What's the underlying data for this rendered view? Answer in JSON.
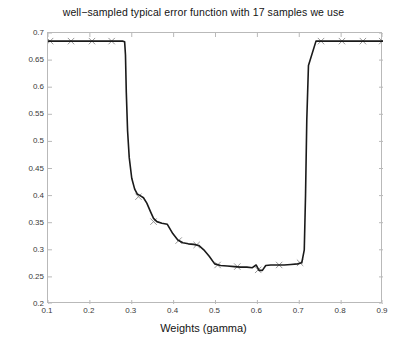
{
  "chart_data": {
    "type": "line",
    "title": "well−sampled typical error function with 17 samples we use",
    "xlabel": "Weights (gamma)",
    "ylabel": "Error",
    "xlim": [
      0.1,
      0.9
    ],
    "ylim": [
      0.2,
      0.7
    ],
    "xticks": [
      "0.1",
      "0.2",
      "0.3",
      "0.4",
      "0.5",
      "0.6",
      "0.7",
      "0.8",
      "0.9"
    ],
    "xtick_values": [
      0.1,
      0.2,
      0.3,
      0.4,
      0.5,
      0.6,
      0.7,
      0.8,
      0.9
    ],
    "yticks": [
      "0.2",
      "0.25",
      "0.3",
      "0.35",
      "0.4",
      "0.45",
      "0.5",
      "0.55",
      "0.6",
      "0.65",
      "0.7"
    ],
    "ytick_values": [
      0.2,
      0.25,
      0.3,
      0.35,
      0.4,
      0.45,
      0.5,
      0.55,
      0.6,
      0.65,
      0.7
    ],
    "grid": false,
    "legend": null,
    "line_color": "#1a1a1a",
    "line_width": 1.6,
    "marker": "x",
    "marker_color": "#8c8c8c",
    "series": [
      {
        "name": "error",
        "x": [
          0.1,
          0.13,
          0.16,
          0.19,
          0.215,
          0.24,
          0.262,
          0.278,
          0.283,
          0.285,
          0.287,
          0.29,
          0.294,
          0.3,
          0.307,
          0.313,
          0.32,
          0.328,
          0.336,
          0.345,
          0.352,
          0.36,
          0.372,
          0.385,
          0.398,
          0.41,
          0.422,
          0.435,
          0.448,
          0.46,
          0.472,
          0.485,
          0.498,
          0.512,
          0.528,
          0.545,
          0.56,
          0.575,
          0.588,
          0.597,
          0.604,
          0.612,
          0.62,
          0.632,
          0.648,
          0.664,
          0.68,
          0.696,
          0.706,
          0.712,
          0.715,
          0.718,
          0.722,
          0.74,
          0.77,
          0.8,
          0.83,
          0.86,
          0.9
        ],
        "y": [
          0.685,
          0.685,
          0.685,
          0.685,
          0.685,
          0.685,
          0.685,
          0.685,
          0.684,
          0.66,
          0.59,
          0.52,
          0.47,
          0.432,
          0.412,
          0.403,
          0.4,
          0.396,
          0.386,
          0.37,
          0.358,
          0.352,
          0.349,
          0.347,
          0.33,
          0.318,
          0.313,
          0.311,
          0.31,
          0.308,
          0.3,
          0.288,
          0.274,
          0.271,
          0.27,
          0.269,
          0.268,
          0.268,
          0.267,
          0.272,
          0.262,
          0.262,
          0.271,
          0.272,
          0.272,
          0.272,
          0.273,
          0.274,
          0.276,
          0.3,
          0.4,
          0.54,
          0.64,
          0.685,
          0.685,
          0.685,
          0.685,
          0.685,
          0.685
        ]
      }
    ],
    "markers": [
      {
        "x": 0.155,
        "y": 0.685
      },
      {
        "x": 0.205,
        "y": 0.685
      },
      {
        "x": 0.252,
        "y": 0.685
      },
      {
        "x": 0.105,
        "y": 0.685
      },
      {
        "x": 0.316,
        "y": 0.398
      },
      {
        "x": 0.352,
        "y": 0.352
      },
      {
        "x": 0.412,
        "y": 0.317
      },
      {
        "x": 0.455,
        "y": 0.309
      },
      {
        "x": 0.505,
        "y": 0.272
      },
      {
        "x": 0.552,
        "y": 0.269
      },
      {
        "x": 0.602,
        "y": 0.263
      },
      {
        "x": 0.652,
        "y": 0.272
      },
      {
        "x": 0.702,
        "y": 0.276
      },
      {
        "x": 0.752,
        "y": 0.685
      },
      {
        "x": 0.802,
        "y": 0.685
      },
      {
        "x": 0.852,
        "y": 0.685
      },
      {
        "x": 0.898,
        "y": 0.685
      }
    ]
  }
}
